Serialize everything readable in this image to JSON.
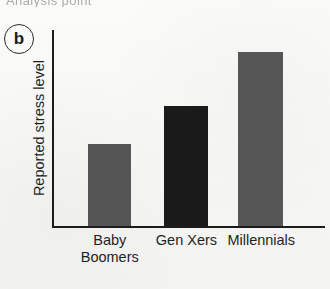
{
  "figure": {
    "panel_label": "b",
    "clipped_caption_fragment": "Analysis point",
    "background_color": "#f7f7f5",
    "axis_color": "#1c1c1c"
  },
  "chart_data": {
    "type": "bar",
    "title": "",
    "xlabel": "",
    "ylabel": "Reported stress level",
    "categories": [
      "Baby\nBoomers",
      "Gen Xers",
      "Millennials"
    ],
    "category_labels_flat": [
      "Baby Boomers",
      "Gen Xers",
      "Millennials"
    ],
    "values": [
      42,
      61,
      89
    ],
    "ylim": [
      0,
      100
    ],
    "xlim": [
      0,
      3
    ],
    "grid": false,
    "legend": null,
    "axis_tick_labels_y": [],
    "bar_colors": [
      "#555555",
      "#1a1a1a",
      "#565656"
    ],
    "bars": [
      {
        "category": "Baby\nBoomers",
        "value": 42,
        "color": "#555555",
        "left_pct": 12.5,
        "width_pct": 16.0
      },
      {
        "category": "Gen Xers",
        "value": 61,
        "color": "#1a1a1a",
        "left_pct": 40.6,
        "width_pct": 16.2
      },
      {
        "category": "Millennials",
        "value": 89,
        "color": "#565656",
        "left_pct": 67.9,
        "width_pct": 16.6
      }
    ],
    "tick_label_positions_pct": [
      20.5,
      48.7,
      76.2
    ]
  }
}
